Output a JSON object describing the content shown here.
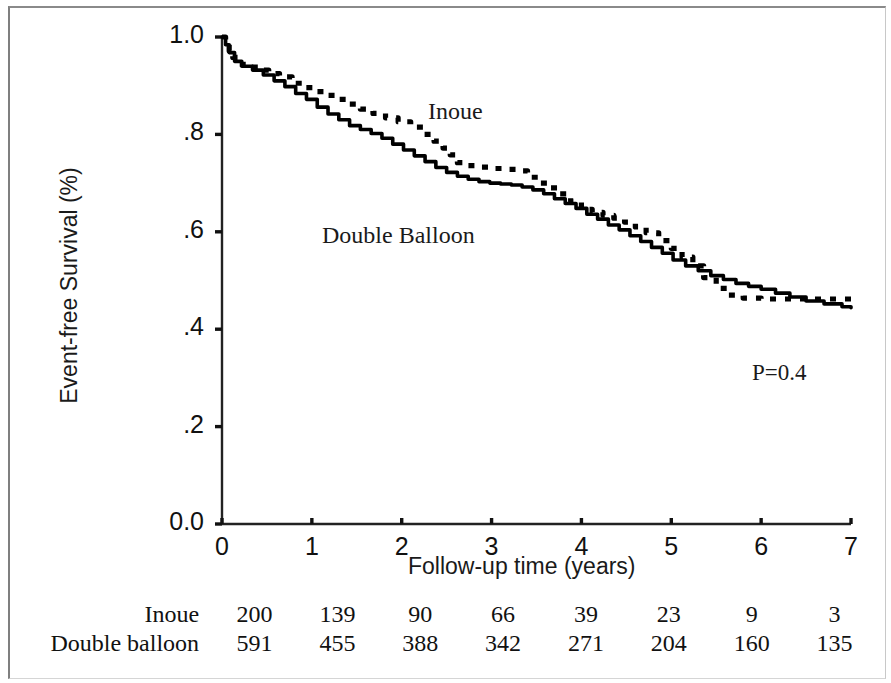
{
  "figure": {
    "pvalue_label": "P=0.4"
  },
  "chart_data": {
    "type": "line",
    "title": "",
    "subtitle": "",
    "xlabel": "Follow-up time (years)",
    "ylabel": "Event-free Survival (%)",
    "xlim": [
      0,
      7
    ],
    "ylim": [
      0,
      1
    ],
    "grid": false,
    "legend_position": "in-plot-annotations",
    "xticks": [
      "0",
      "1",
      "2",
      "3",
      "4",
      "5",
      "6",
      "7"
    ],
    "xtick_values": [
      0,
      1,
      2,
      3,
      4,
      5,
      6,
      7
    ],
    "yticks": [
      "0.0",
      ".2",
      ".4",
      ".6",
      ".8",
      "1.0"
    ],
    "ytick_values": [
      0.0,
      0.2,
      0.4,
      0.6,
      0.8,
      1.0
    ],
    "annotations": [
      {
        "text": "Inoue",
        "x": 3.05,
        "y": 0.875
      },
      {
        "text": "Double Balloon",
        "x": 1.85,
        "y": 0.625
      },
      {
        "text": "P=0.4",
        "x": 6.3,
        "y": 0.34
      }
    ],
    "series": [
      {
        "name": "Inoue",
        "style": "dotted",
        "color": "#000000",
        "x": [
          0.0,
          0.04,
          0.08,
          0.12,
          0.18,
          0.28,
          0.4,
          0.52,
          0.64,
          0.78,
          0.9,
          1.02,
          1.14,
          1.26,
          1.4,
          1.54,
          1.68,
          1.82,
          1.96,
          2.1,
          2.24,
          2.36,
          2.46,
          2.54,
          2.62,
          2.72,
          2.86,
          3.0,
          3.14,
          3.28,
          3.4,
          3.52,
          3.64,
          3.76,
          3.88,
          4.0,
          4.12,
          4.24,
          4.36,
          4.48,
          4.6,
          4.72,
          4.86,
          5.0,
          5.12,
          5.24,
          5.36,
          5.5,
          5.64,
          5.8,
          6.0,
          6.2,
          6.4,
          6.6,
          6.8,
          7.0
        ],
        "y": [
          1.0,
          0.985,
          0.972,
          0.958,
          0.944,
          0.938,
          0.932,
          0.925,
          0.918,
          0.905,
          0.896,
          0.888,
          0.88,
          0.872,
          0.862,
          0.852,
          0.843,
          0.834,
          0.826,
          0.815,
          0.8,
          0.786,
          0.772,
          0.758,
          0.742,
          0.736,
          0.733,
          0.73,
          0.728,
          0.725,
          0.712,
          0.7,
          0.69,
          0.678,
          0.662,
          0.646,
          0.64,
          0.634,
          0.628,
          0.62,
          0.61,
          0.598,
          0.582,
          0.566,
          0.548,
          0.53,
          0.506,
          0.484,
          0.47,
          0.464,
          0.462,
          0.462,
          0.462,
          0.462,
          0.462,
          0.462
        ]
      },
      {
        "name": "Double balloon",
        "style": "solid",
        "color": "#000000",
        "x": [
          0.0,
          0.04,
          0.08,
          0.14,
          0.22,
          0.34,
          0.46,
          0.58,
          0.7,
          0.82,
          0.94,
          1.06,
          1.18,
          1.3,
          1.42,
          1.54,
          1.66,
          1.78,
          1.9,
          2.02,
          2.14,
          2.26,
          2.38,
          2.5,
          2.62,
          2.74,
          2.86,
          2.98,
          3.1,
          3.22,
          3.34,
          3.46,
          3.58,
          3.7,
          3.82,
          3.94,
          4.06,
          4.18,
          4.3,
          4.42,
          4.54,
          4.66,
          4.78,
          4.9,
          5.02,
          5.16,
          5.3,
          5.44,
          5.58,
          5.72,
          5.86,
          6.0,
          6.16,
          6.32,
          6.5,
          6.7,
          6.9,
          7.0
        ],
        "y": [
          1.0,
          0.984,
          0.968,
          0.95,
          0.94,
          0.932,
          0.922,
          0.91,
          0.898,
          0.884,
          0.872,
          0.856,
          0.842,
          0.83,
          0.818,
          0.81,
          0.802,
          0.792,
          0.78,
          0.768,
          0.756,
          0.744,
          0.732,
          0.722,
          0.714,
          0.708,
          0.703,
          0.7,
          0.698,
          0.696,
          0.692,
          0.686,
          0.678,
          0.668,
          0.658,
          0.648,
          0.636,
          0.626,
          0.614,
          0.604,
          0.592,
          0.58,
          0.568,
          0.556,
          0.542,
          0.53,
          0.52,
          0.51,
          0.502,
          0.494,
          0.488,
          0.482,
          0.474,
          0.466,
          0.458,
          0.452,
          0.446,
          0.444
        ]
      }
    ]
  },
  "risk_table": {
    "rows": [
      {
        "label": "Inoue",
        "values": [
          "200",
          "139",
          "90",
          "66",
          "39",
          "23",
          "9",
          "3"
        ]
      },
      {
        "label": "Double balloon",
        "values": [
          "591",
          "455",
          "388",
          "342",
          "271",
          "204",
          "160",
          "135"
        ]
      }
    ]
  }
}
